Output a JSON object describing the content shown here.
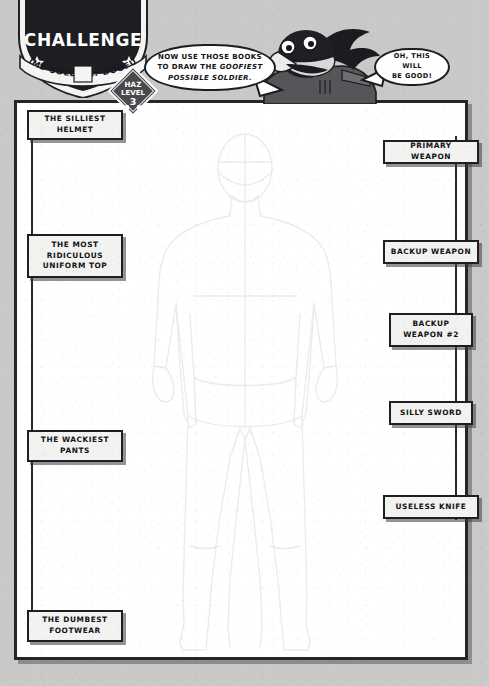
{
  "page": {
    "background_color": "#c9c9c7",
    "paper_color": "#ffffff",
    "ink_color": "#1f1f23"
  },
  "badge": {
    "title": "CHALLENGE",
    "banner": "TIME SOLDIER: DOOFUS",
    "star_left": "star-icon",
    "star_right": "star-icon"
  },
  "hazard": {
    "line1": "HAZ",
    "line2": "LEVEL",
    "line3": "3"
  },
  "dialogue": {
    "left": {
      "line1": "NOW USE THOSE BOOKS",
      "line2_plain": "TO DRAW THE ",
      "line2_em": "GOOFIEST",
      "line3_em": "POSSIBLE SOLDIER."
    },
    "right": {
      "line1": "OH, THIS WILL",
      "line2": "BE GOOD!"
    }
  },
  "character": {
    "name": "crow-mascot"
  },
  "labels_left": [
    {
      "id": "silliest-helmet",
      "text": "THE SILLIEST\nHELMET"
    },
    {
      "id": "most-ridiculous-uniform-top",
      "text": "THE MOST\nRIDICULOUS\nUNIFORM TOP"
    },
    {
      "id": "wackiest-pants",
      "text": "THE WACKIEST\nPANTS"
    },
    {
      "id": "dumbest-footwear",
      "text": "THE DUMBEST\nFOOTWEAR"
    }
  ],
  "labels_right": [
    {
      "id": "primary-weapon",
      "text": "PRIMARY WEAPON"
    },
    {
      "id": "backup-weapon",
      "text": "BACKUP WEAPON"
    },
    {
      "id": "backup-weapon-2",
      "text": "BACKUP\nWEAPON #2"
    },
    {
      "id": "silly-sword",
      "text": "SILLY SWORD"
    },
    {
      "id": "useless-knife",
      "text": "USELESS KNIFE"
    }
  ],
  "figure": {
    "name": "blank-soldier-body-template"
  }
}
